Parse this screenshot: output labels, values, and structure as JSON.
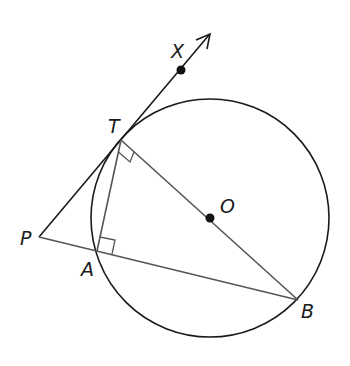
{
  "diagram": {
    "type": "geometry",
    "colors": {
      "circle": "#1a1a1a",
      "tangent": "#1a1a1a",
      "chord": "#555555",
      "point": "#111111"
    },
    "labels": {
      "X": "X",
      "T": "T",
      "O": "O",
      "P": "P",
      "A": "A",
      "B": "B"
    },
    "points": {
      "X": [
        181,
        70
      ],
      "T": [
        121,
        140
      ],
      "O": [
        210,
        218
      ],
      "P": [
        39,
        237
      ],
      "A": [
        97,
        251
      ],
      "B": [
        298,
        300
      ],
      "arrow_tip": [
        210,
        34
      ]
    },
    "circle": {
      "cx": 210,
      "cy": 218,
      "r": 119
    },
    "right_angles": [
      "T (between TA and TB)",
      "A (between AT and AB)"
    ],
    "segments": [
      "PX (tangent ray)",
      "PB (secant)",
      "TB (diameter)",
      "TA"
    ]
  }
}
